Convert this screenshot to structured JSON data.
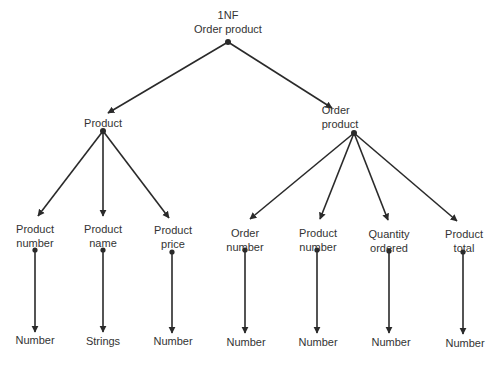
{
  "diagram": {
    "title": "1NF",
    "colors": {
      "line": "#2a2a2a",
      "text": "#333333",
      "background": "#ffffff"
    },
    "root": {
      "line1": "1NF",
      "line2": "Order product"
    },
    "groups": [
      {
        "line1": "Product",
        "line2": "",
        "children": [
          {
            "line1": "Product",
            "line2": "number",
            "type": "Number"
          },
          {
            "line1": "Product",
            "line2": "name",
            "type": "Strings"
          },
          {
            "line1": "Product",
            "line2": "price",
            "type": "Number"
          }
        ]
      },
      {
        "line1": "Order",
        "line2": "product",
        "children": [
          {
            "line1": "Order",
            "line2": "number",
            "type": "Number"
          },
          {
            "line1": "Product",
            "line2": "number",
            "type": "Number"
          },
          {
            "line1": "Quantity",
            "line2": "ordered",
            "type": "Number"
          },
          {
            "line1": "Product",
            "line2": "total",
            "type": "Number"
          }
        ]
      }
    ]
  }
}
